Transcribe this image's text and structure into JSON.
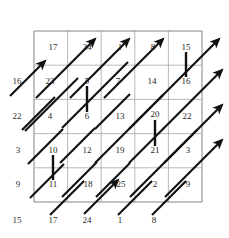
{
  "figure": {
    "type": "lattice-diagram",
    "grid": {
      "rows": 5,
      "cols": 5,
      "left": 34,
      "top": 31,
      "right": 202,
      "bottom": 202,
      "cell_w": 33.6,
      "cell_h": 34.2
    },
    "colors": {
      "background": "#ffffff",
      "grid_line": "#9b9b9b",
      "border_line": "#777777",
      "arrow": "#111111",
      "wall": "#111111",
      "text": "#1f1f1f"
    }
  },
  "cell_numbers": [
    {
      "label": "17",
      "x": 53,
      "y": 47
    },
    {
      "label": "24",
      "x": 87,
      "y": 47
    },
    {
      "label": "1",
      "x": 120,
      "y": 47
    },
    {
      "label": "8",
      "x": 153,
      "y": 47
    },
    {
      "label": "15",
      "x": 186,
      "y": 47
    },
    {
      "label": "23",
      "x": 50,
      "y": 81
    },
    {
      "label": "5",
      "x": 87,
      "y": 81
    },
    {
      "label": "7",
      "x": 118,
      "y": 81
    },
    {
      "label": "14",
      "x": 152,
      "y": 81
    },
    {
      "label": "16",
      "x": 186,
      "y": 81
    },
    {
      "label": "4",
      "x": 50,
      "y": 116
    },
    {
      "label": "6",
      "x": 87,
      "y": 116
    },
    {
      "label": "13",
      "x": 120,
      "y": 116
    },
    {
      "label": "20",
      "x": 155,
      "y": 114
    },
    {
      "label": "22",
      "x": 187,
      "y": 116
    },
    {
      "label": "10",
      "x": 53,
      "y": 150
    },
    {
      "label": "12",
      "x": 87,
      "y": 150
    },
    {
      "label": "19",
      "x": 120,
      "y": 150
    },
    {
      "label": "21",
      "x": 155,
      "y": 150
    },
    {
      "label": "3",
      "x": 188,
      "y": 150
    },
    {
      "label": "11",
      "x": 53,
      "y": 184
    },
    {
      "label": "18",
      "x": 88,
      "y": 184
    },
    {
      "label": "25",
      "x": 121,
      "y": 184
    },
    {
      "label": "2",
      "x": 155,
      "y": 184
    },
    {
      "label": "9",
      "x": 188,
      "y": 184
    }
  ],
  "left_labels": [
    {
      "label": "16",
      "x": 17,
      "y": 81
    },
    {
      "label": "22",
      "x": 17,
      "y": 116
    },
    {
      "label": "3",
      "x": 18,
      "y": 150
    },
    {
      "label": "9",
      "x": 18,
      "y": 184
    },
    {
      "label": "15",
      "x": 17,
      "y": 220
    }
  ],
  "bottom_labels": [
    {
      "label": "17",
      "x": 53,
      "y": 220
    },
    {
      "label": "24",
      "x": 87,
      "y": 220
    },
    {
      "label": "1",
      "x": 120,
      "y": 220
    },
    {
      "label": "8",
      "x": 154,
      "y": 220
    }
  ],
  "walls": [
    {
      "name": "wall-5-6",
      "x": 87,
      "y1": 86,
      "y2": 112
    },
    {
      "name": "wall-15-16",
      "x": 186,
      "y1": 52,
      "y2": 77
    },
    {
      "name": "wall-20-21",
      "x": 155,
      "y1": 120,
      "y2": 146
    },
    {
      "name": "wall-10-11",
      "x": 53,
      "y1": 155,
      "y2": 180
    }
  ],
  "arrows": [
    {
      "name": "arrow-1",
      "x1": 10,
      "y1": 96,
      "x2": 45,
      "y2": 61,
      "head": true
    },
    {
      "name": "arrow-2",
      "x1": 22,
      "y1": 130,
      "x2": 55,
      "y2": 97,
      "head": false
    },
    {
      "name": "arrow-3",
      "x1": 25,
      "y1": 131,
      "x2": 78,
      "y2": 78,
      "head": false
    },
    {
      "name": "arrow-4",
      "x1": 28,
      "y1": 164,
      "x2": 63,
      "y2": 129,
      "head": false
    },
    {
      "name": "arrow-5",
      "x1": 30,
      "y1": 198,
      "x2": 64,
      "y2": 164,
      "head": false
    },
    {
      "name": "arrow-6",
      "x1": 36,
      "y1": 98,
      "x2": 95,
      "y2": 39,
      "head": true
    },
    {
      "name": "arrow-7",
      "x1": 62,
      "y1": 128,
      "x2": 128,
      "y2": 62,
      "head": false
    },
    {
      "name": "arrow-8",
      "x1": 60,
      "y1": 163,
      "x2": 95,
      "y2": 128,
      "head": false
    },
    {
      "name": "arrow-9",
      "x1": 62,
      "y1": 197,
      "x2": 97,
      "y2": 162,
      "head": false
    },
    {
      "name": "arrow-10",
      "x1": 50,
      "y1": 215,
      "x2": 84,
      "y2": 181,
      "head": false
    },
    {
      "name": "arrow-11",
      "x1": 70,
      "y1": 98,
      "x2": 129,
      "y2": 39,
      "head": true
    },
    {
      "name": "arrow-12",
      "x1": 95,
      "y1": 129,
      "x2": 130,
      "y2": 94,
      "head": false
    },
    {
      "name": "arrow-13",
      "x1": 95,
      "y1": 163,
      "x2": 163,
      "y2": 95,
      "head": false
    },
    {
      "name": "arrow-14",
      "x1": 96,
      "y1": 197,
      "x2": 130,
      "y2": 163,
      "head": false
    },
    {
      "name": "arrow-15",
      "x1": 84,
      "y1": 214,
      "x2": 118,
      "y2": 180,
      "head": true
    },
    {
      "name": "arrow-16",
      "x1": 104,
      "y1": 98,
      "x2": 163,
      "y2": 39,
      "head": true
    },
    {
      "name": "arrow-17",
      "x1": 129,
      "y1": 129,
      "x2": 163,
      "y2": 95,
      "head": false
    },
    {
      "name": "arrow-18",
      "x1": 129,
      "y1": 163,
      "x2": 164,
      "y2": 128,
      "head": false
    },
    {
      "name": "arrow-19",
      "x1": 130,
      "y1": 197,
      "x2": 197,
      "y2": 130,
      "head": false
    },
    {
      "name": "arrow-20",
      "x1": 118,
      "y1": 215,
      "x2": 152,
      "y2": 181,
      "head": false
    },
    {
      "name": "arrow-21",
      "x1": 160,
      "y1": 98,
      "x2": 219,
      "y2": 39,
      "head": true
    },
    {
      "name": "arrow-22",
      "x1": 163,
      "y1": 129,
      "x2": 222,
      "y2": 70,
      "head": true
    },
    {
      "name": "arrow-23",
      "x1": 164,
      "y1": 163,
      "x2": 222,
      "y2": 105,
      "head": true
    },
    {
      "name": "arrow-24",
      "x1": 165,
      "y1": 197,
      "x2": 222,
      "y2": 140,
      "head": true
    },
    {
      "name": "arrow-25",
      "x1": 152,
      "y1": 215,
      "x2": 186,
      "y2": 181,
      "head": false
    }
  ]
}
